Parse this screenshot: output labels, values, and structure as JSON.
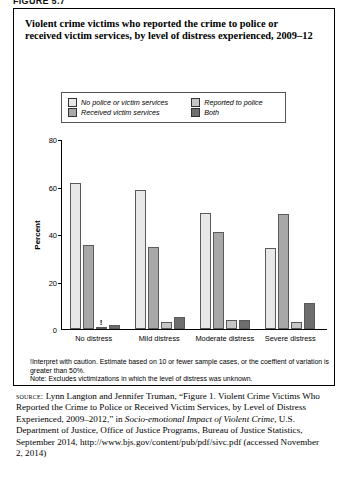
{
  "figure_label": "FIGURE 5.7",
  "title": "Violent crime victims who reported the crime to police or received victim services, by level of distress experienced, 2009–12",
  "legend": {
    "items": [
      {
        "label": "No police or victim services",
        "color": "#e8e8e8"
      },
      {
        "label": "Reported to police",
        "color": "#c6c6c6"
      },
      {
        "label": "Received victim services",
        "color": "#a8a8a8"
      },
      {
        "label": "Both",
        "color": "#6e6e6e"
      }
    ]
  },
  "notes": {
    "caution": "!Interpret with caution. Estimate based on 10 or fewer sample cases, or the coeffient of variation is greater than 50%.",
    "note": "Note: Excludes victimizations in which the level of distress was unknown."
  },
  "source": {
    "kicker": "source:",
    "line1": " Lynn Langton and Jennifer Truman, “Figure 1. Violent Crime Victims Who Reported the Crime to Police or Received Victim Services, by Level of Distress Experienced, 2009–2012,” in ",
    "publication": "Socio-emotional Impact of Violent Crime",
    "line2": ", U.S. Department of Justice, Office of Justice Programs, Bureau of Justice Statistics, September 2014, http://www.bjs.gov/content/pub/pdf/sivc.pdf (accessed November 2, 2014)"
  },
  "chart_data": {
    "type": "bar",
    "title": "Violent crime victims who reported the crime to police or received victim services, by level of distress experienced, 2009–12",
    "xlabel": "",
    "ylabel": "Percent",
    "ylim": [
      0,
      80
    ],
    "yticks": [
      0,
      20,
      40,
      60,
      80
    ],
    "grid": false,
    "legend_position": "top",
    "categories": [
      "No distress",
      "Mild distress",
      "Moderate distress",
      "Severe distress"
    ],
    "series": [
      {
        "name": "No police or victim services",
        "color": "#e8e8e8",
        "values": [
          61.5,
          58.5,
          49.0,
          34.0
        ]
      },
      {
        "name": "Received victim services",
        "color": "#a8a8a8",
        "values": [
          35.5,
          34.5,
          41.0,
          48.5
        ]
      },
      {
        "name": "Reported to police",
        "color": "#c6c6c6",
        "values": [
          0.5,
          3.0,
          4.0,
          3.0
        ]
      },
      {
        "name": "Both",
        "color": "#6e6e6e",
        "values": [
          1.5,
          5.0,
          4.0,
          11.0
        ]
      }
    ],
    "annotations": [
      {
        "series": "Reported to police",
        "category": "No distress",
        "marker": "!"
      }
    ]
  }
}
